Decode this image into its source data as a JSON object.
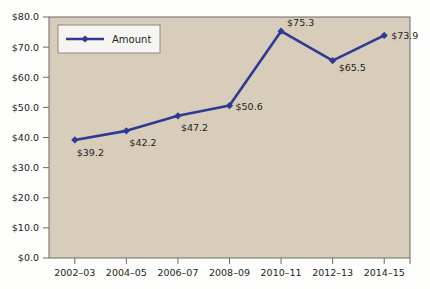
{
  "chart_data": {
    "type": "line",
    "title": "",
    "subtitle": "",
    "xlabel": "",
    "ylabel": "",
    "categories": [
      "2002–03",
      "2004–05",
      "2006–07",
      "2008–09",
      "2010–11",
      "2012–13",
      "2014–15"
    ],
    "series": [
      {
        "name": "Amount",
        "values": [
          39.2,
          42.2,
          47.2,
          50.6,
          75.3,
          65.5,
          73.9
        ],
        "point_labels": [
          "$39.2",
          "$42.2",
          "$47.2",
          "$50.6",
          "$75.3",
          "$65.5",
          "$73.9"
        ],
        "color": "#2e3a94",
        "marker": "diamond"
      }
    ],
    "ylim": [
      0,
      80
    ],
    "ytick_values": [
      0,
      10,
      20,
      30,
      40,
      50,
      60,
      70,
      80
    ],
    "ytick_labels": [
      "$0.0",
      "$10.0",
      "$20.0",
      "$30.0",
      "$40.0",
      "$50.0",
      "$60.0",
      "$70.0",
      "$80.0"
    ],
    "grid": false,
    "legend": {
      "position": "top-left-inside",
      "entries": [
        "Amount"
      ]
    },
    "colors": {
      "plot_background": "#d8cdba",
      "page_background": "#fdfdfb",
      "series": "#2e3a94",
      "axis": "#6e6b66",
      "text": "#231f20",
      "legend_background": "#f7f5f1",
      "legend_border": "#8d8a85"
    }
  }
}
